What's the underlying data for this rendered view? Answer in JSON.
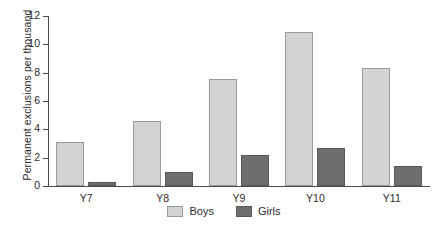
{
  "chart_data": {
    "type": "bar",
    "title": "",
    "subtitle": "",
    "xlabel": "",
    "ylabel": "Permanent exclusions per thousand",
    "categories": [
      "Y7",
      "Y8",
      "Y9",
      "Y10",
      "Y11"
    ],
    "series": [
      {
        "name": "Boys",
        "color": "#d3d3d3",
        "values": [
          3.1,
          4.6,
          7.55,
          10.9,
          8.3
        ]
      },
      {
        "name": "Girls",
        "color": "#6e6e6e",
        "values": [
          0.3,
          1.0,
          2.2,
          2.7,
          1.4
        ]
      }
    ],
    "ylim": [
      0,
      12
    ],
    "yticks": [
      0,
      2,
      4,
      6,
      8,
      10,
      12
    ],
    "ytick_labels": [
      "0",
      "2",
      "4",
      "6",
      "8",
      "10",
      "12"
    ],
    "grid": false,
    "legend_position": "bottom-center",
    "legend_entries": [
      "Boys",
      "Girls"
    ],
    "annotations": []
  },
  "colors": {
    "boys": "#d3d3d3",
    "girls": "#6e6e6e",
    "axis": "#4a4a4a",
    "text": "#2b2b2b",
    "background": "#ffffff"
  }
}
